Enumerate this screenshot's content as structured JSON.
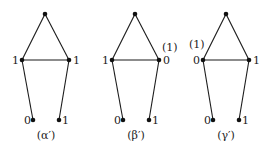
{
  "graphs": [
    {
      "id": "alpha",
      "caption": "(α′)",
      "nodes": {
        "top": {
          "x": 45,
          "y": 14,
          "label": ""
        },
        "left": {
          "x": 22,
          "y": 60,
          "label": "1"
        },
        "right": {
          "x": 69,
          "y": 60,
          "label": "1"
        },
        "bottom_left": {
          "x": 33,
          "y": 120,
          "label": "0"
        },
        "bottom_right": {
          "x": 59,
          "y": 120,
          "label": "1"
        }
      },
      "extra_label": {
        "text": "",
        "x": 0,
        "y": 0
      }
    },
    {
      "id": "beta",
      "caption": "(β′)",
      "nodes": {
        "top": {
          "x": 135,
          "y": 14,
          "label": ""
        },
        "left": {
          "x": 112,
          "y": 60,
          "label": "1"
        },
        "right": {
          "x": 159,
          "y": 60,
          "label": "0"
        },
        "bottom_left": {
          "x": 123,
          "y": 120,
          "label": "0"
        },
        "bottom_right": {
          "x": 149,
          "y": 120,
          "label": "1"
        }
      },
      "extra_label": {
        "text": "(1)",
        "x": 162,
        "y": 51
      }
    },
    {
      "id": "gamma",
      "caption": "(γ′)",
      "nodes": {
        "top": {
          "x": 226,
          "y": 14,
          "label": ""
        },
        "left": {
          "x": 203,
          "y": 60,
          "label": "0"
        },
        "right": {
          "x": 249,
          "y": 60,
          "label": "1"
        },
        "bottom_left": {
          "x": 213,
          "y": 120,
          "label": "0"
        },
        "bottom_right": {
          "x": 239,
          "y": 120,
          "label": "1"
        }
      },
      "extra_label": {
        "text": "(1)",
        "x": 189,
        "y": 48
      }
    }
  ]
}
